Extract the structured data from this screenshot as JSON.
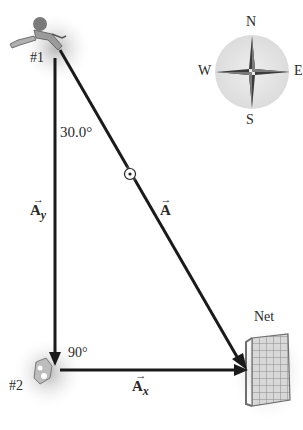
{
  "diagram": {
    "angle_label": "30.0°",
    "right_angle_label": "90°",
    "players": [
      {
        "id": "player-1",
        "label": "#1"
      },
      {
        "id": "player-2",
        "label": "#2"
      }
    ],
    "goal_label": "Net",
    "vectors": {
      "A": {
        "symbol": "A",
        "arrow": "→"
      },
      "Ay": {
        "symbol": "A",
        "subscript": "y",
        "arrow": "→"
      },
      "Ax": {
        "symbol": "A",
        "subscript": "x",
        "arrow": "→"
      }
    },
    "compass": {
      "north": "N",
      "south": "S",
      "east": "E",
      "west": "W"
    },
    "colors": {
      "line": "#1a1a1a",
      "text": "#2a2a2a",
      "shadow": "#bdbdbd",
      "compass_bg": "#e4e4e4",
      "compass_star": "#555555"
    }
  }
}
